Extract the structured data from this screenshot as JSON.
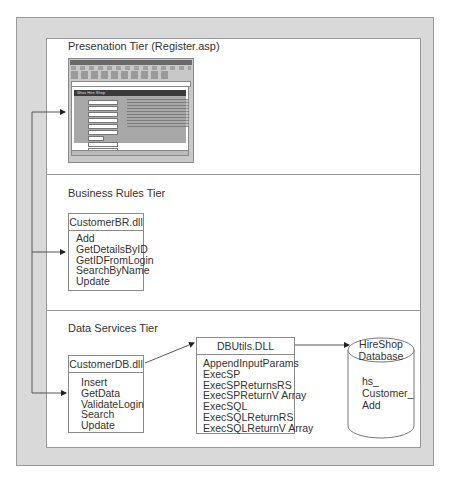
{
  "diagram": {
    "tiers": [
      {
        "title": "Presenation Tier (Register.asp)",
        "screenshot": {
          "page_heading": "Wrox Hire Shop",
          "description": "Embedded browser screenshot of a registration form"
        }
      },
      {
        "title": "Business Rules Tier",
        "components": [
          {
            "name": "CustomerBR.dll",
            "methods": [
              "Add",
              "GetDetailsByID",
              "GetIDFromLogin",
              "SearchByName",
              "Update"
            ]
          }
        ]
      },
      {
        "title": "Data Services Tier",
        "components": [
          {
            "name": "CustomerDB.dll",
            "methods": [
              "Insert",
              "GetData",
              "ValidateLogin",
              "Search",
              "Update"
            ]
          },
          {
            "name": "DBUtils.DLL",
            "methods": [
              "AppendInputParams",
              "ExecSP",
              "ExecSPReturnsRS",
              "ExecSPReturnV Array",
              "ExecSQL",
              "ExecSQLReturnRS",
              "ExecSQLReturnV Array"
            ]
          }
        ],
        "database": {
          "name_line1": "HireShop",
          "name_line2": "Database",
          "content_lines": [
            "hs_",
            "Customer_",
            "Add"
          ]
        }
      }
    ],
    "colors": {
      "frame": "#d9d9d9",
      "border": "#9a9a9a",
      "line": "#555555"
    }
  }
}
